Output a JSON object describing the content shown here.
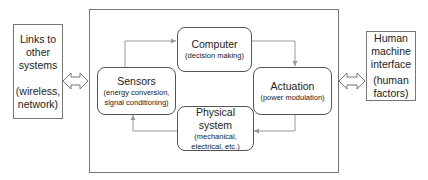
{
  "diagram": {
    "left_panel": {
      "lines": [
        "Links to",
        "other",
        "systems",
        "",
        "(wireless,",
        "network)"
      ]
    },
    "right_panel": {
      "lines": [
        "Human",
        "machine",
        "interface",
        "",
        "(human",
        "factors)"
      ]
    },
    "nodes": {
      "computer": {
        "title": "Computer",
        "subtitle": "(decision making)"
      },
      "sensors": {
        "title": "Sensors",
        "subtitle_1": "(energy conversion,",
        "subtitle_2": "signal conditioning)"
      },
      "actuation": {
        "title": "Actuation",
        "subtitle": "(power modulation)"
      },
      "physical": {
        "title": "Physical system",
        "subtitle_1": "(mechanical,",
        "subtitle_2": "electrical, etc.)"
      }
    },
    "edges": [
      {
        "from": "sensors",
        "to": "computer"
      },
      {
        "from": "computer",
        "to": "actuation"
      },
      {
        "from": "actuation",
        "to": "physical"
      },
      {
        "from": "physical",
        "to": "sensors"
      },
      {
        "from": "left_panel",
        "to": "main_system",
        "bidirectional": true
      },
      {
        "from": "main_system",
        "to": "right_panel",
        "bidirectional": true
      }
    ],
    "colors": {
      "line": "#777777",
      "arrow": "#999999"
    }
  }
}
